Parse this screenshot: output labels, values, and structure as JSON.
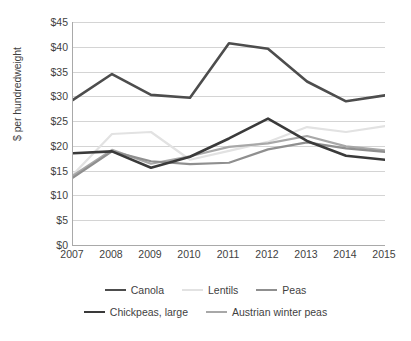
{
  "chart_data": {
    "type": "line",
    "title": "",
    "xlabel": "",
    "ylabel": "$ per hundredweight",
    "categories": [
      "2007",
      "2008",
      "2009",
      "2010",
      "2011",
      "2012",
      "2013",
      "2014",
      "2015"
    ],
    "ylim": [
      0,
      45
    ],
    "ytick_step": 5,
    "ytick_labels": [
      "$45",
      "$40",
      "$35",
      "$30",
      "$25",
      "$20",
      "$15",
      "$10",
      "$5",
      "$0"
    ],
    "ytick_values": [
      45,
      40,
      35,
      30,
      25,
      20,
      15,
      10,
      5,
      0
    ],
    "grid": true,
    "legend_position": "bottom",
    "series": [
      {
        "name": "Canola",
        "color": "#4d4d4d",
        "width": 2.6,
        "values": [
          29.3,
          34.5,
          30.3,
          29.7,
          40.7,
          39.6,
          33.0,
          29.0,
          30.2
        ]
      },
      {
        "name": "Lentils",
        "color": "#e2e2e2",
        "width": 2.2,
        "values": [
          14.2,
          22.4,
          22.8,
          17.2,
          19.0,
          20.8,
          23.8,
          22.8,
          24.0
        ]
      },
      {
        "name": "Peas",
        "color": "#8f8f8f",
        "width": 2.2,
        "values": [
          13.6,
          18.9,
          16.9,
          16.3,
          16.6,
          19.3,
          20.7,
          19.5,
          18.8
        ]
      },
      {
        "name": "Chickpeas, large",
        "color": "#3a3a3a",
        "width": 2.6,
        "values": [
          18.5,
          18.9,
          15.6,
          17.8,
          21.5,
          25.5,
          21.0,
          18.0,
          17.2
        ]
      },
      {
        "name": "Austrian winter peas",
        "color": "#a8a8a8",
        "width": 2.2,
        "values": [
          14.0,
          19.2,
          16.4,
          17.9,
          19.8,
          20.5,
          22.0,
          19.9,
          19.1
        ]
      }
    ],
    "legend_rows": [
      [
        "Canola",
        "Lentils",
        "Peas"
      ],
      [
        "Chickpeas, large",
        "Austrian winter peas"
      ]
    ]
  }
}
